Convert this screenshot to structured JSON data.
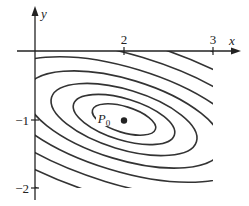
{
  "chart_data": {
    "type": "contour",
    "title": "",
    "xlabel": "x",
    "ylabel": "y",
    "xlim": [
      1,
      3
    ],
    "ylim": [
      -2,
      0
    ],
    "x_ticks": [
      {
        "value": 2,
        "label": "2"
      },
      {
        "value": 3,
        "label": "3"
      }
    ],
    "y_ticks": [
      {
        "value": -1,
        "label": "-1"
      },
      {
        "value": -2,
        "label": "-2"
      }
    ],
    "grid": false,
    "legend": null,
    "center_point": {
      "label": "P0",
      "label_main": "P",
      "label_sub": "0",
      "x": 2,
      "y": -1
    },
    "contours": {
      "shape": "concentric rotated ellipses",
      "center": [
        2,
        -1
      ],
      "rotation_deg": -17,
      "count": 40,
      "innermost_semi_axes": [
        0.37,
        0.14
      ],
      "spacing": "decreasing outward (level sets of quadratic function)"
    },
    "colors": {
      "line": "#333333",
      "background": "#ffffff",
      "point": "#222222"
    }
  },
  "axes": {
    "x_label": "x",
    "y_label": "y",
    "tick_x2": "2",
    "tick_x3": "3",
    "tick_ym1": "−1",
    "tick_ym2": "−2"
  },
  "point": {
    "main": "P",
    "sub": "0"
  }
}
